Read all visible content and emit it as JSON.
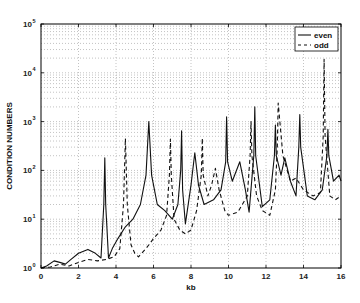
{
  "chart_data": {
    "type": "line",
    "title": "",
    "xlabel": "kb",
    "ylabel": "CONDITION  NUMBERS",
    "xlim": [
      0,
      16
    ],
    "ylim": [
      1,
      100000
    ],
    "yscale": "log",
    "xticks": [
      0,
      2,
      4,
      6,
      8,
      10,
      12,
      14,
      16
    ],
    "xtick_labels": [
      "0",
      "2",
      "4",
      "6",
      "8",
      "10",
      "12",
      "14",
      "16"
    ],
    "yticks_exp": [
      0,
      1,
      2,
      3,
      4,
      5
    ],
    "ytick_base": "10",
    "grid": true,
    "legend_position": "upper right",
    "legend": [
      "even",
      "odd"
    ],
    "series": [
      {
        "name": "even",
        "style": "solid",
        "x": [
          0,
          0.3,
          0.7,
          1.0,
          1.3,
          1.6,
          2.0,
          2.5,
          2.9,
          3.2,
          3.35,
          3.4,
          3.45,
          3.6,
          3.8,
          4.1,
          4.5,
          4.9,
          5.3,
          5.6,
          5.75,
          5.9,
          6.2,
          6.6,
          7.0,
          7.3,
          7.45,
          7.5,
          7.55,
          7.7,
          8.0,
          8.2,
          8.4,
          8.7,
          9.2,
          9.6,
          9.85,
          9.9,
          9.95,
          10.2,
          10.6,
          10.9,
          11.1,
          11.35,
          11.4,
          11.45,
          11.8,
          12.2,
          12.45,
          12.5,
          12.55,
          12.8,
          13.0,
          13.3,
          13.6,
          13.75,
          13.8,
          13.85,
          14.2,
          14.6,
          15.0,
          15.25,
          15.3,
          15.35,
          15.6,
          15.9,
          16.0
        ],
        "y": [
          1,
          1.1,
          1.4,
          1.3,
          1.2,
          1.5,
          2.0,
          2.4,
          2.0,
          1.6,
          20,
          180,
          20,
          1.6,
          2.5,
          4,
          7,
          10,
          20,
          80,
          1000,
          80,
          20,
          15,
          10,
          20,
          100,
          650,
          40,
          8,
          50,
          230,
          50,
          20,
          25,
          40,
          150,
          1250,
          150,
          60,
          150,
          40,
          14,
          200,
          2000,
          200,
          18,
          25,
          200,
          850,
          200,
          80,
          180,
          60,
          30,
          300,
          1400,
          300,
          30,
          25,
          40,
          200,
          700,
          200,
          60,
          80,
          60
        ]
      },
      {
        "name": "odd",
        "style": "dashed",
        "x": [
          0,
          0.5,
          1.0,
          1.5,
          2.0,
          2.5,
          3.0,
          3.5,
          3.9,
          4.2,
          4.4,
          4.5,
          4.6,
          4.8,
          5.0,
          5.2,
          5.6,
          6.0,
          6.4,
          6.7,
          6.85,
          6.9,
          6.95,
          7.1,
          7.4,
          7.7,
          8.0,
          8.3,
          8.55,
          8.6,
          8.65,
          8.9,
          9.1,
          9.3,
          9.5,
          9.8,
          10.0,
          10.5,
          11.0,
          11.15,
          11.2,
          11.25,
          11.5,
          11.8,
          12.2,
          12.5,
          12.6,
          12.65,
          12.9,
          13.3,
          13.6,
          14.0,
          14.5,
          14.9,
          15.05,
          15.1,
          15.15,
          15.4,
          15.7,
          16.0
        ],
        "y": [
          1,
          1.05,
          1.2,
          1.1,
          1.3,
          1.5,
          1.4,
          1.5,
          1.7,
          2.5,
          20,
          450,
          20,
          3,
          2,
          1.7,
          2.5,
          4,
          6,
          12,
          80,
          440,
          80,
          10,
          6,
          5,
          6,
          15,
          80,
          460,
          80,
          30,
          50,
          110,
          40,
          15,
          12,
          14,
          30,
          200,
          1000,
          200,
          30,
          15,
          12,
          40,
          300,
          2400,
          200,
          60,
          70,
          40,
          30,
          35,
          500,
          19000,
          500,
          30,
          25,
          30
        ]
      }
    ]
  },
  "legend": {
    "items": [
      {
        "label": "even",
        "style": "solid"
      },
      {
        "label": "odd",
        "style": "dashed"
      }
    ]
  },
  "axes": {
    "xlabel": "kb",
    "ylabel": "CONDITION  NUMBERS"
  },
  "colors": {
    "line": "#111111",
    "grid": "#9a9a9a",
    "axis": "#000000",
    "background": "#ffffff"
  }
}
